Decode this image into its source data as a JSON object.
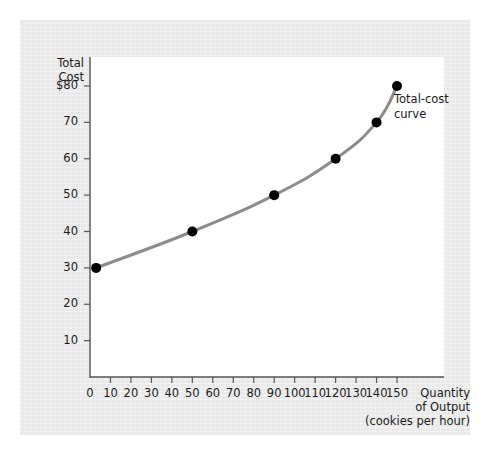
{
  "figure": {
    "panel_bg": "#e9e9e9",
    "plot_bg": "#ffffff",
    "axis_color": "#555555",
    "curve_color": "#8c8c8c",
    "marker_color": "#000000",
    "text_color": "#1a1a1a"
  },
  "labels": {
    "y_axis_line1": "Total",
    "y_axis_line2": "Cost",
    "x_axis_line1": "Quantity",
    "x_axis_line2": "of Output",
    "x_axis_line3": "(cookies per hour)",
    "annotation_line1": "Total-cost",
    "annotation_line2": "curve"
  },
  "chart_data": {
    "type": "line",
    "title": "",
    "xlabel": "Quantity of Output (cookies per hour)",
    "ylabel": "Total Cost",
    "xlim": [
      0,
      165
    ],
    "ylim": [
      0,
      88
    ],
    "grid": false,
    "legend": "none",
    "annotations": [
      {
        "text": "Total-cost curve",
        "x": 150,
        "y": 80
      }
    ],
    "x_ticks": [
      0,
      10,
      20,
      30,
      40,
      50,
      60,
      70,
      80,
      90,
      100,
      110,
      120,
      130,
      140,
      150
    ],
    "x_tick_labels": [
      "0",
      "10",
      "20",
      "30",
      "40",
      "50",
      "60",
      "70",
      "80",
      "90",
      "100",
      "110",
      "120",
      "130",
      "140",
      "150"
    ],
    "y_ticks": [
      10,
      20,
      30,
      40,
      50,
      60,
      70,
      80
    ],
    "y_tick_labels": [
      "10",
      "20",
      "30",
      "40",
      "50",
      "60",
      "70",
      "$80"
    ],
    "series": [
      {
        "name": "Total-cost curve",
        "x": [
          3,
          50,
          90,
          120,
          140,
          150
        ],
        "y": [
          30,
          40,
          50,
          60,
          70,
          80
        ],
        "marker": "circle",
        "marker_size": 5,
        "line_width": 3,
        "color": "#8c8c8c"
      }
    ]
  }
}
